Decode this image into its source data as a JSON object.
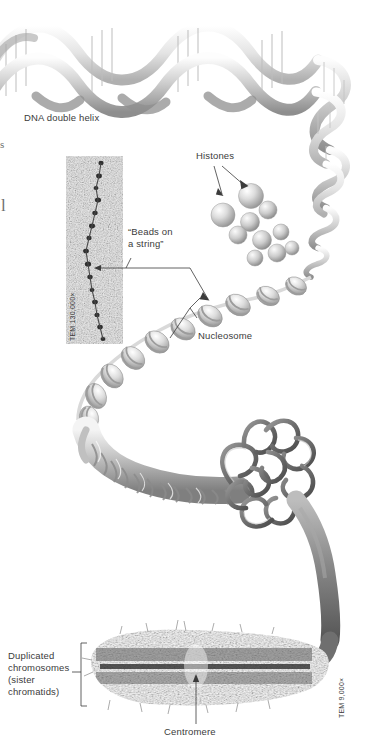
{
  "figure": {
    "background_color": "#ffffff",
    "text_color": "#3b3b3b",
    "width": 370,
    "height": 752
  },
  "labels": {
    "dna_double_helix": "DNA double helix",
    "histones": "Histones",
    "beads_on_a_string_line1": "“Beads on",
    "beads_on_a_string_line2": "a string”",
    "nucleosome": "Nucleosome",
    "duplicated_line1": "Duplicated",
    "duplicated_line2": "chromosomes",
    "duplicated_line3": "(sister",
    "duplicated_line4": "chromatids)",
    "centromere": "Centromere"
  },
  "micrographs": {
    "beads_tem_credit": "TEM 130,000×",
    "chromosome_tem_credit": "TEM 9,000×"
  },
  "margin_artifacts": {
    "glyph_top": "s",
    "glyph_bottom": "l"
  },
  "structures": {
    "helix": "dna-double-helix-ribbon",
    "nucleosome_chain": "beads-on-a-string-fiber",
    "histone_spheres_count": 9,
    "fiber_30nm": "supercoiled-30nm-fiber",
    "looped_domains": "looped-domain-chromatin",
    "metaphase_chromosome": "duplicated-chromosome-sister-chromatids"
  }
}
